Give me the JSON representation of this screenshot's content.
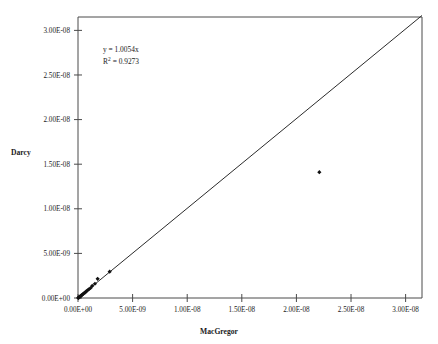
{
  "chart_data": {
    "type": "scatter",
    "title": "",
    "xlabel": "MacGregor",
    "ylabel": "Darcy",
    "xlim": [
      0,
      3.15e-08
    ],
    "ylim": [
      0,
      3.15e-08
    ],
    "grid": false,
    "legend": "none",
    "x_ticks": [
      0,
      5e-09,
      1e-08,
      1.5e-08,
      2e-08,
      2.5e-08,
      3e-08
    ],
    "y_ticks": [
      0,
      5e-09,
      1e-08,
      1.5e-08,
      2e-08,
      2.5e-08,
      3e-08
    ],
    "x_tick_labels": [
      "0.00E+00",
      "5.00E-09",
      "1.00E-08",
      "1.50E-08",
      "2.00E-08",
      "2.50E-08",
      "3.00E-08"
    ],
    "y_tick_labels": [
      "0.00E+00",
      "5.00E-09",
      "1.00E-08",
      "1.50E-08",
      "2.00E-08",
      "2.50E-08",
      "3.00E-08"
    ],
    "series": [
      {
        "name": "data",
        "marker": "diamond",
        "points": [
          [
            2e-11,
            1e-11
          ],
          [
            5e-11,
            4e-11
          ],
          [
            9e-11,
            7e-11
          ],
          [
            1.4e-10,
            1.2e-10
          ],
          [
            1.9e-10,
            1.7e-10
          ],
          [
            2.5e-10,
            2.3e-10
          ],
          [
            3.2e-10,
            3e-10
          ],
          [
            4e-10,
            3.8e-10
          ],
          [
            4.8e-10,
            4.6e-10
          ],
          [
            5.7e-10,
            5.6e-10
          ],
          [
            6.6e-10,
            6.4e-10
          ],
          [
            7.6e-10,
            7.5e-10
          ],
          [
            8.7e-10,
            8.6e-10
          ],
          [
            1e-09,
            9.8e-10
          ],
          [
            1.15e-09,
            1.12e-09
          ],
          [
            1.3e-09,
            1.35e-09
          ],
          [
            1.55e-09,
            1.6e-09
          ],
          [
            1.8e-09,
            2.15e-09
          ],
          [
            2.9e-09,
            2.95e-09
          ],
          [
            2.21e-08,
            1.41e-08
          ]
        ]
      }
    ],
    "trendline": {
      "equation": "y = 1.0054x",
      "r_squared_label": "R",
      "r_squared_sup": "2",
      "r_squared_value": "= 0.9273",
      "slope": 1.0054,
      "intercept": 0,
      "from": [
        0,
        0
      ],
      "to": [
        3.15e-08,
        3.167e-08
      ]
    },
    "annotation_lines": [
      "y = 1.0054x",
      "R² = 0.9273"
    ],
    "colors": {
      "marker": "#111111",
      "trendline": "#2b2b2b",
      "axis": "#4a4a4a",
      "text": "#1a1a1a",
      "background": "#ffffff"
    }
  }
}
